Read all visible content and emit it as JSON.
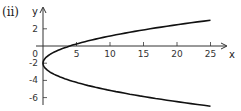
{
  "part_label": "(ii)",
  "chart_data": {
    "type": "line",
    "title": "",
    "equation": "x = (y + 2)^2",
    "xlabel": "x",
    "ylabel": "y",
    "xlim": [
      0,
      25
    ],
    "ylim": [
      -7,
      3
    ],
    "x_ticks": [
      5,
      10,
      15,
      20,
      25
    ],
    "y_ticks": [
      2,
      0,
      -2,
      -4,
      -6
    ],
    "x_tick_labels": [
      "5",
      "10",
      "15",
      "20",
      "25"
    ],
    "y_tick_labels": [
      "2",
      "0",
      "-2",
      "-4",
      "-6"
    ],
    "grid": false,
    "series": [
      {
        "name": "parabola",
        "points": [
          {
            "x": 25,
            "y": 3
          },
          {
            "x": 16,
            "y": 2
          },
          {
            "x": 9,
            "y": 1
          },
          {
            "x": 4,
            "y": 0
          },
          {
            "x": 1,
            "y": -1
          },
          {
            "x": 0,
            "y": -2
          },
          {
            "x": 1,
            "y": -3
          },
          {
            "x": 4,
            "y": -4
          },
          {
            "x": 9,
            "y": -5
          },
          {
            "x": 16,
            "y": -6
          },
          {
            "x": 25,
            "y": -7
          }
        ]
      }
    ]
  }
}
